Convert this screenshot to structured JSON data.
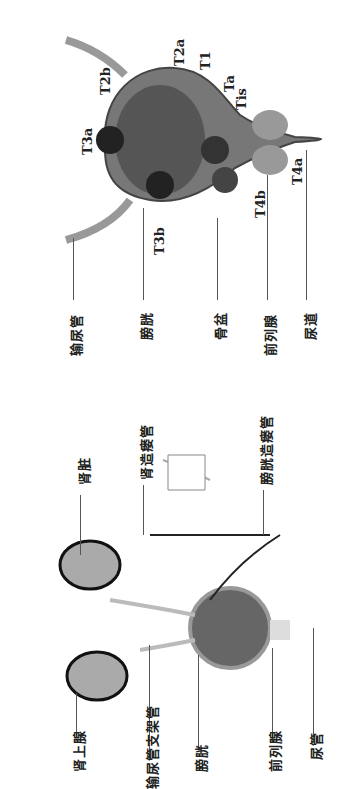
{
  "top_figure": {
    "title": "Bladder cancer T staging",
    "stage_labels": [
      "T2a",
      "T1",
      "Ta",
      "Tis",
      "T2b",
      "T3a",
      "T3b",
      "T4b",
      "T4a"
    ],
    "anatomy_labels": [
      "输尿管",
      "膀胱",
      "骨盆",
      "前列腺",
      "尿道"
    ]
  },
  "bottom_figure": {
    "labels_top": [
      "肾脏",
      "肾造瘘管",
      "膀胱造瘘管"
    ],
    "labels_bottom": [
      "肾上腺",
      "输尿管支架管",
      "膀胱",
      "前列腺",
      "尿管"
    ]
  },
  "colors": {
    "line": "#555555",
    "organ": "#8a8a8a",
    "dark": "#333333"
  }
}
